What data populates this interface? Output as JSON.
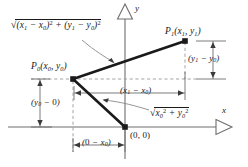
{
  "figure": {
    "axes": {
      "x_label": "x",
      "y_label": "y",
      "arrowhead_style": "hollow-triangle"
    },
    "points": [
      {
        "id": "P1",
        "label_point": "P",
        "label_sub": "1",
        "label_coords": "(x₁, y₁)",
        "x": 185,
        "y": 40
      },
      {
        "id": "P0",
        "label_point": "P",
        "label_sub": "0",
        "label_coords": "(x₀, y₀)",
        "x": 73,
        "y": 79
      },
      {
        "id": "O",
        "label": "(0, 0)",
        "x": 125,
        "y": 127
      }
    ],
    "labels": {
      "p1": "P₁(x₁, y₁)",
      "p0": "P₀(x₀, y₀)",
      "origin": "(0, 0)",
      "distance_p0_p1": "√((x₁ − x₀)² + (y₁ − y₀)²)",
      "distance_p0_origin": "√(x₀² + y₀²)",
      "delta_x": "(x₁ − x₀)",
      "delta_y": "(y₁ − y₀)",
      "y0_minus_0": "(y₀ − 0)",
      "zero_minus_x0": "(0 − x₀)"
    },
    "colors": {
      "ink": "#1a1a1a",
      "axis": "#6e6e6e",
      "dashed": "#9a9a9a",
      "leader": "#8a8a8a",
      "background": "#ffffff"
    }
  }
}
